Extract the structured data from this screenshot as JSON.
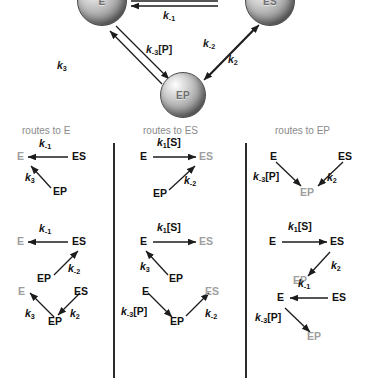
{
  "figure": {
    "species": {
      "e": "E",
      "es": "ES",
      "ep": "EP"
    },
    "rates": {
      "k1S": {
        "k": "k",
        "sub": "1",
        "bracket": "[S]"
      },
      "km1": {
        "k": "k",
        "sub": "-1",
        "bracket": ""
      },
      "k2": {
        "k": "k",
        "sub": "2",
        "bracket": ""
      },
      "km2": {
        "k": "k",
        "sub": "-2",
        "bracket": ""
      },
      "k3": {
        "k": "k",
        "sub": "3",
        "bracket": ""
      },
      "km3P": {
        "k": "k",
        "sub": "-3",
        "bracket": "[P]"
      }
    }
  },
  "cycle": {
    "nodes": [
      {
        "id": "e",
        "label": "E"
      },
      {
        "id": "es",
        "label": "ES"
      },
      {
        "id": "ep",
        "label": "EP"
      }
    ],
    "edge_labels": {
      "top_reverse": "k-1",
      "left_inner": "k-3[P]",
      "left_outer": "k3",
      "right_inner": "k-2",
      "right_outer": "k2"
    }
  },
  "columns": [
    {
      "id": "to-e",
      "header": "routes to E"
    },
    {
      "id": "to-es",
      "header": "routes to ES"
    },
    {
      "id": "to-ep",
      "header": "routes to EP"
    }
  ],
  "panels": {
    "r1c1": {
      "target": "E",
      "nodes": [
        "E",
        "ES",
        "EP"
      ],
      "labels": [
        "k-1",
        "k3"
      ]
    },
    "r1c2": {
      "target": "ES",
      "nodes": [
        "E",
        "ES",
        "EP"
      ],
      "labels": [
        "k1[S]",
        "k-2"
      ]
    },
    "r1c3": {
      "target": "EP",
      "nodes": [
        "E",
        "ES",
        "EP"
      ],
      "labels": [
        "k-3[P]",
        "k2"
      ]
    },
    "r2c1": {
      "target": "E",
      "nodes": [
        "E",
        "ES",
        "EP"
      ],
      "labels": [
        "k-1",
        "k-2"
      ]
    },
    "r2c2": {
      "target": "ES",
      "nodes": [
        "E",
        "ES",
        "EP"
      ],
      "labels": [
        "k1[S]",
        "k3"
      ]
    },
    "r2c3": {
      "target": "EP",
      "nodes": [
        "E",
        "ES",
        "EP"
      ],
      "labels": [
        "k1[S]",
        "k2"
      ]
    },
    "r3c1": {
      "target": "E",
      "nodes": [
        "E",
        "ES",
        "EP"
      ],
      "labels": [
        "k3",
        "k2"
      ]
    },
    "r3c2": {
      "target": "ES",
      "nodes": [
        "E",
        "ES",
        "EP"
      ],
      "labels": [
        "k-3[P]",
        "k-2"
      ]
    },
    "r3c3": {
      "target": "EP",
      "nodes": [
        "E",
        "ES",
        "EP"
      ],
      "labels": [
        "k-1",
        "k-3[P]"
      ]
    }
  },
  "colors": {
    "source_text": "#111111",
    "target_text": "#9e9e9e",
    "header_text": "#8a8a8a",
    "arrow": "#1c1c1c",
    "divider": "#2b2b2b",
    "background": "#ffffff"
  }
}
